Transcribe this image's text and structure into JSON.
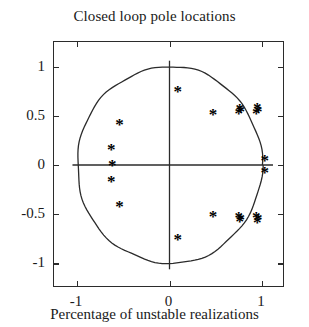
{
  "chart_data": {
    "type": "scatter",
    "title": "Closed loop pole locations",
    "xlabel": "Percentage of unstable realizations",
    "ylabel": "",
    "xlim": [
      -1.25,
      1.25
    ],
    "ylim": [
      -1.25,
      1.25
    ],
    "grid": false,
    "legend": null,
    "marker": "*",
    "marker_color": "#000000",
    "xticks": [
      -1,
      0,
      1
    ],
    "xtick_labels": [
      "-1",
      "0",
      "1"
    ],
    "yticks": [
      -1,
      -0.5,
      0,
      0.5,
      1
    ],
    "ytick_labels": [
      "-1",
      "-0.5",
      "0",
      "0.5",
      "1"
    ],
    "annotations": [
      {
        "name": "unit-circle",
        "type": "circle",
        "cx": 0,
        "cy": 0,
        "r": 1
      },
      {
        "name": "real-axis",
        "type": "hline",
        "y": 0
      },
      {
        "name": "imaginary-axis",
        "type": "vline",
        "x": 0
      }
    ],
    "points": [
      {
        "x": -0.54,
        "y": 0.42
      },
      {
        "x": -0.63,
        "y": 0.16
      },
      {
        "x": -0.63,
        "y": -0.16
      },
      {
        "x": -0.54,
        "y": -0.42
      },
      {
        "x": -0.62,
        "y": 0.0
      },
      {
        "x": 0.09,
        "y": 0.75
      },
      {
        "x": 0.09,
        "y": -0.75
      },
      {
        "x": 0.47,
        "y": 0.52
      },
      {
        "x": 0.47,
        "y": -0.52
      },
      {
        "x": 0.76,
        "y": 0.57
      },
      {
        "x": 0.77,
        "y": 0.55
      },
      {
        "x": 0.75,
        "y": 0.53
      },
      {
        "x": 0.76,
        "y": -0.57
      },
      {
        "x": 0.77,
        "y": -0.55
      },
      {
        "x": 0.75,
        "y": -0.53
      },
      {
        "x": 0.95,
        "y": 0.58
      },
      {
        "x": 0.96,
        "y": 0.55
      },
      {
        "x": 0.94,
        "y": 0.53
      },
      {
        "x": 0.95,
        "y": -0.58
      },
      {
        "x": 0.96,
        "y": -0.55
      },
      {
        "x": 0.94,
        "y": -0.53
      },
      {
        "x": 1.03,
        "y": 0.05
      },
      {
        "x": 1.03,
        "y": -0.07
      }
    ]
  }
}
